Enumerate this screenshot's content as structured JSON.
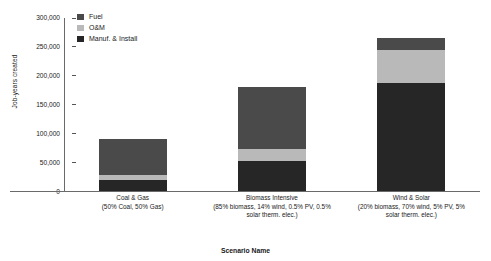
{
  "chart_data": {
    "type": "bar",
    "subtype": "stacked-vertical",
    "title": "",
    "xlabel": "Scenario Name",
    "ylabel": "Job-years created",
    "ylim": [
      0,
      300000
    ],
    "ytick_labels": [
      "300,000",
      "250,000",
      "200,000",
      "150,000",
      "100,000",
      "50,000",
      "0"
    ],
    "ytick_values": [
      300000,
      250000,
      200000,
      150000,
      100000,
      50000,
      0
    ],
    "grid": false,
    "legend_position": "upper-left-inside",
    "categories": [
      "Coal & Gas",
      "Biomass Intensive",
      "Wind & Solar"
    ],
    "category_sublabels": [
      "(50% Coal, 50% Gas)",
      "(85% biomass, 14% wind, 0.5% PV, 0.5% solar therm. elec.)",
      "(20% biomass, 70% wind, 5% PV, 5% solar therm. elec.)"
    ],
    "series": [
      {
        "name": "Manuf. & Install",
        "color": "#262626",
        "values": [
          19000,
          52000,
          187000
        ]
      },
      {
        "name": "O&M",
        "color": "#b9b9b9",
        "values": [
          9000,
          21000,
          57000
        ]
      },
      {
        "name": "Fuel",
        "color": "#4a4a4a",
        "values": [
          62000,
          107000,
          21000
        ]
      }
    ],
    "totals": [
      90000,
      180000,
      265000
    ]
  },
  "legend": {
    "entries": [
      {
        "label": "Fuel",
        "color": "#4a4a4a"
      },
      {
        "label": "O&M",
        "color": "#b9b9b9"
      },
      {
        "label": "Manuf. & Install",
        "color": "#262626"
      }
    ]
  },
  "axes": {
    "y_title": "Job-years created",
    "x_title": "Scenario Name"
  }
}
